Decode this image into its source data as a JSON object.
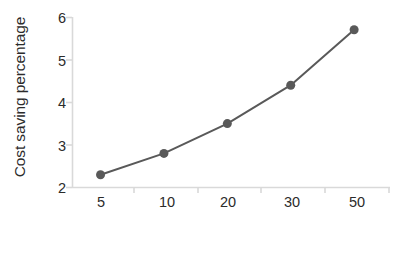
{
  "chart_data": {
    "type": "line",
    "title": "",
    "subtitle": "",
    "xlabel": "Number of micro grids",
    "ylabel": "Cost saving percentage",
    "categories": [
      "5",
      "10",
      "20",
      "30",
      "50"
    ],
    "values": [
      2.3,
      2.8,
      3.5,
      4.4,
      5.7
    ],
    "series": [
      {
        "name": "Cost saving percentage",
        "values": [
          2.3,
          2.8,
          3.5,
          4.4,
          5.7
        ]
      }
    ],
    "ylim": [
      2,
      6
    ],
    "yticks": [
      "2",
      "3",
      "4",
      "5",
      "6"
    ],
    "ytick_values": [
      2,
      3,
      4,
      5,
      6
    ],
    "xticks": [
      "5",
      "10",
      "20",
      "30",
      "50"
    ],
    "grid": false,
    "legend": false,
    "legend_position": "none",
    "annotations": [],
    "colors": {
      "line": "#595959",
      "marker": "#595959",
      "axis": "#d9d9d9",
      "text": "#2b2b2b",
      "background": "#ffffff"
    },
    "marker_style": "circle",
    "marker_size": 9,
    "line_width": 2
  }
}
